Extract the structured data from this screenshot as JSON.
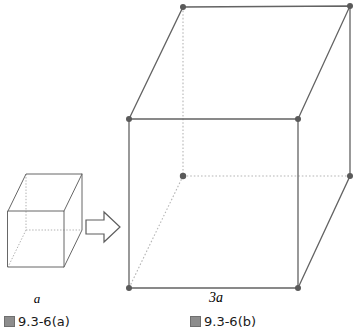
{
  "figure": {
    "stroke_color": "#575757",
    "hidden_stroke_color": "#a8a8a8",
    "vertex_color": "#5a5a5a",
    "arrow_color": "#585858",
    "small_cube": {
      "name": "small-cube",
      "edge_label": "a",
      "front_face": [
        [
          8,
          211
        ],
        [
          64,
          211
        ],
        [
          64,
          267
        ],
        [
          8,
          267
        ]
      ],
      "back_face": [
        [
          26,
          174
        ],
        [
          82,
          174
        ],
        [
          82,
          230
        ],
        [
          26,
          230
        ]
      ]
    },
    "large_cube": {
      "name": "large-cube",
      "edge_label": "3a",
      "front_face": [
        [
          129,
          119
        ],
        [
          298,
          119
        ],
        [
          298,
          288
        ],
        [
          129,
          288
        ]
      ],
      "back_face": [
        [
          183,
          7
        ],
        [
          350,
          6
        ],
        [
          350,
          176
        ],
        [
          183,
          176
        ]
      ],
      "hidden_vertex": [
        183,
        176
      ]
    },
    "arrow": {
      "name": "right-arrow",
      "points": "86,220 104,220 104,212 120,227 104,242 104,234 86,234"
    }
  },
  "labels": {
    "small_edge": "a",
    "large_edge": "3a",
    "caption_a_cjk": "图",
    "caption_a": "9.3-6(a)",
    "caption_b_cjk": "图",
    "caption_b": "9.3-6(b)"
  }
}
